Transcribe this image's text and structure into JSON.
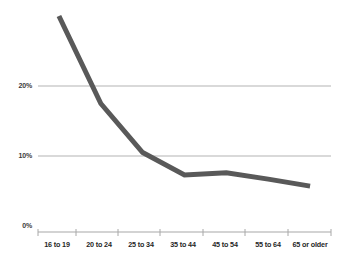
{
  "chart_data": {
    "type": "line",
    "title": "",
    "subtitle": "",
    "xlabel": "",
    "ylabel": "",
    "categories": [
      "16 to 19",
      "20 to 24",
      "25 to 34",
      "35 to 44",
      "45 to 54",
      "55 to 64",
      "65 or older"
    ],
    "series": [
      {
        "name": "",
        "values": [
          30.0,
          17.5,
          10.5,
          7.3,
          7.6,
          6.7,
          5.7
        ],
        "color": "#595959"
      }
    ],
    "ylim": [
      0,
      31
    ],
    "ytick_values": [
      0,
      10,
      20
    ],
    "ytick_labels": [
      "0%",
      "10%",
      "20%"
    ],
    "grid": "horizontal",
    "gridline_color": "#b3b3b3",
    "legend": "none",
    "axis_color": "#9a9a9a",
    "line_width": 5,
    "annotations": []
  }
}
